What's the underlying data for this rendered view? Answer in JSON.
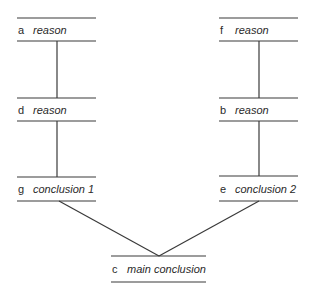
{
  "diagram": {
    "type": "argument-structure",
    "line_color": "#3a3a3a",
    "nodes": [
      {
        "id": "a",
        "letter": "a",
        "text": "reason"
      },
      {
        "id": "d",
        "letter": "d",
        "text": "reason"
      },
      {
        "id": "g",
        "letter": "g",
        "text": "conclusion 1"
      },
      {
        "id": "f",
        "letter": "f",
        "text": "reason"
      },
      {
        "id": "b",
        "letter": "b",
        "text": "reason"
      },
      {
        "id": "e",
        "letter": "e",
        "text": "conclusion 2"
      },
      {
        "id": "c",
        "letter": "c",
        "text": "main conclusion"
      }
    ],
    "edges": [
      {
        "from": "a",
        "to": "d"
      },
      {
        "from": "d",
        "to": "g"
      },
      {
        "from": "f",
        "to": "b"
      },
      {
        "from": "b",
        "to": "e"
      },
      {
        "from": "g",
        "to": "c"
      },
      {
        "from": "e",
        "to": "c"
      }
    ]
  }
}
